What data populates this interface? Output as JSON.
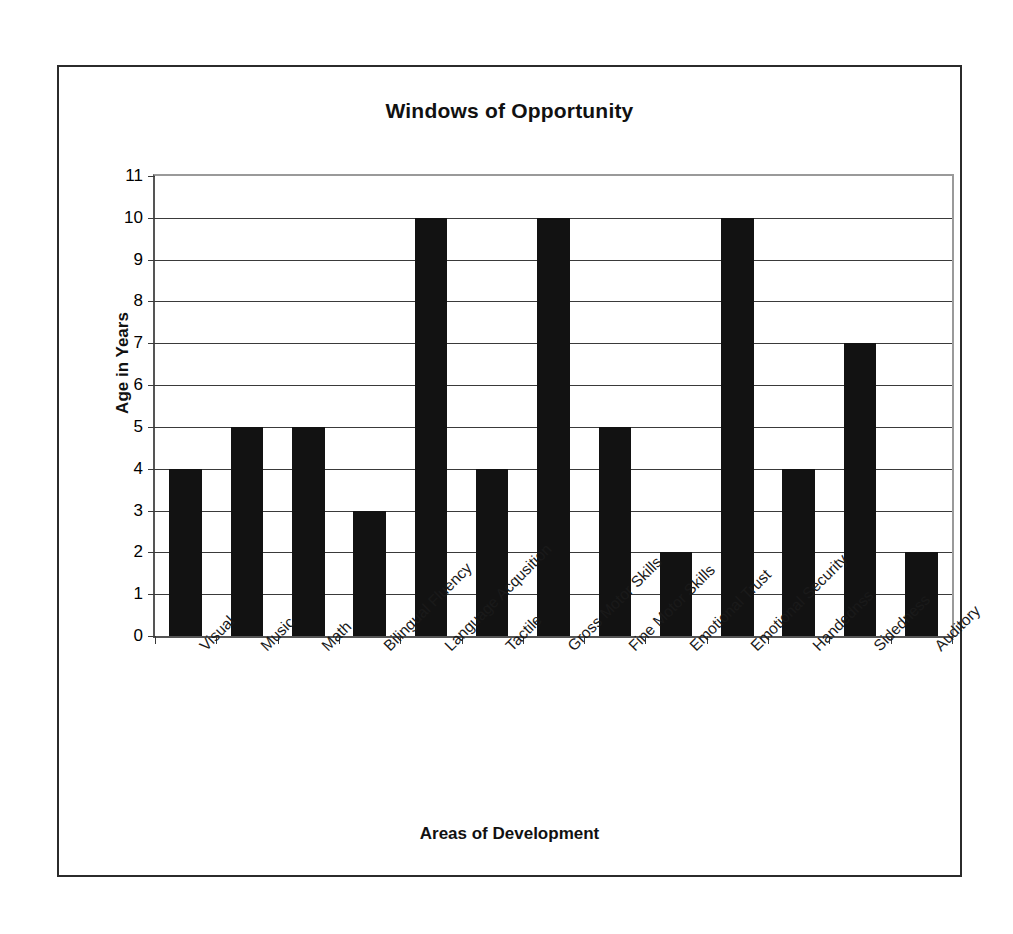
{
  "chart_data": {
    "type": "bar",
    "title": "Windows of Opportunity",
    "xlabel": "Areas of Development",
    "ylabel": "Age in Years",
    "categories": [
      "Visual",
      "Music",
      "Math",
      "Bilingual Fluency",
      "Language Acqusition",
      "Tactile",
      "Gross Motor Skills",
      "Fine Motor Skills",
      "Emotional Trust",
      "Emotional Security",
      "Handednss",
      "Sidedness",
      "Auditory"
    ],
    "values": [
      4,
      5,
      5,
      3,
      10,
      4,
      10,
      5,
      2,
      10,
      4,
      7,
      2
    ],
    "ylim": [
      0,
      11
    ],
    "yticks": [
      0,
      1,
      2,
      3,
      4,
      5,
      6,
      7,
      8,
      9,
      10,
      11
    ],
    "ytick_labels": [
      "0",
      "1",
      "2",
      "3",
      "4",
      "5",
      "6",
      "7",
      "8",
      "9",
      "10",
      "11"
    ],
    "grid": true,
    "grid_axis": "y",
    "legend": false,
    "bar_color": "#121212",
    "plot_background": "#ffffff",
    "grid_color": "#3a3a3a",
    "frame_color": "#2b2b2b",
    "xtick_label_rotation": -45
  }
}
